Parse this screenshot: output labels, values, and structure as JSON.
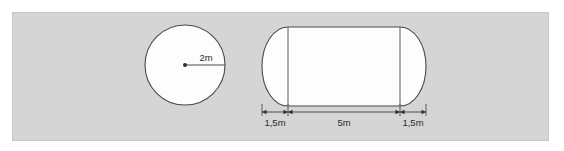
{
  "figure": {
    "background_color": "#d5d5d5",
    "shape_fill_color": "#fdfdfd",
    "outline_color": "#4a4a4a",
    "panel": {
      "x": 12,
      "y": 12,
      "width": 536,
      "height": 128
    }
  },
  "circle": {
    "name": "cross-section-circle",
    "center_x": 185,
    "center_y": 65,
    "radius_px": 40,
    "radius_label": "2m",
    "radius_label_x": 206,
    "radius_label_y": 61,
    "radius_line": {
      "x1": 185,
      "y1": 65,
      "x2": 225,
      "y2": 65
    },
    "center_dot_radius": 2
  },
  "capsule": {
    "name": "side-view-capsule",
    "left": 262,
    "right": 426,
    "top": 27,
    "bottom": 106,
    "cap_width": 26,
    "body_left": 288,
    "body_right": 400,
    "inner_lines": [
      288,
      400
    ]
  },
  "dimensions": {
    "line_y": 112,
    "extension_top": 104,
    "extension_bottom": 116,
    "label_y": 126,
    "ticks": [
      262,
      288,
      400,
      426
    ],
    "segments": [
      {
        "label": "1,5m",
        "start": 262,
        "end": 288,
        "label_x": 275,
        "name": "dimension-left-cap"
      },
      {
        "label": "5m",
        "start": 288,
        "end": 400,
        "label_x": 344,
        "name": "dimension-body"
      },
      {
        "label": "1,5m",
        "start": 400,
        "end": 426,
        "label_x": 413,
        "name": "dimension-right-cap"
      }
    ]
  }
}
